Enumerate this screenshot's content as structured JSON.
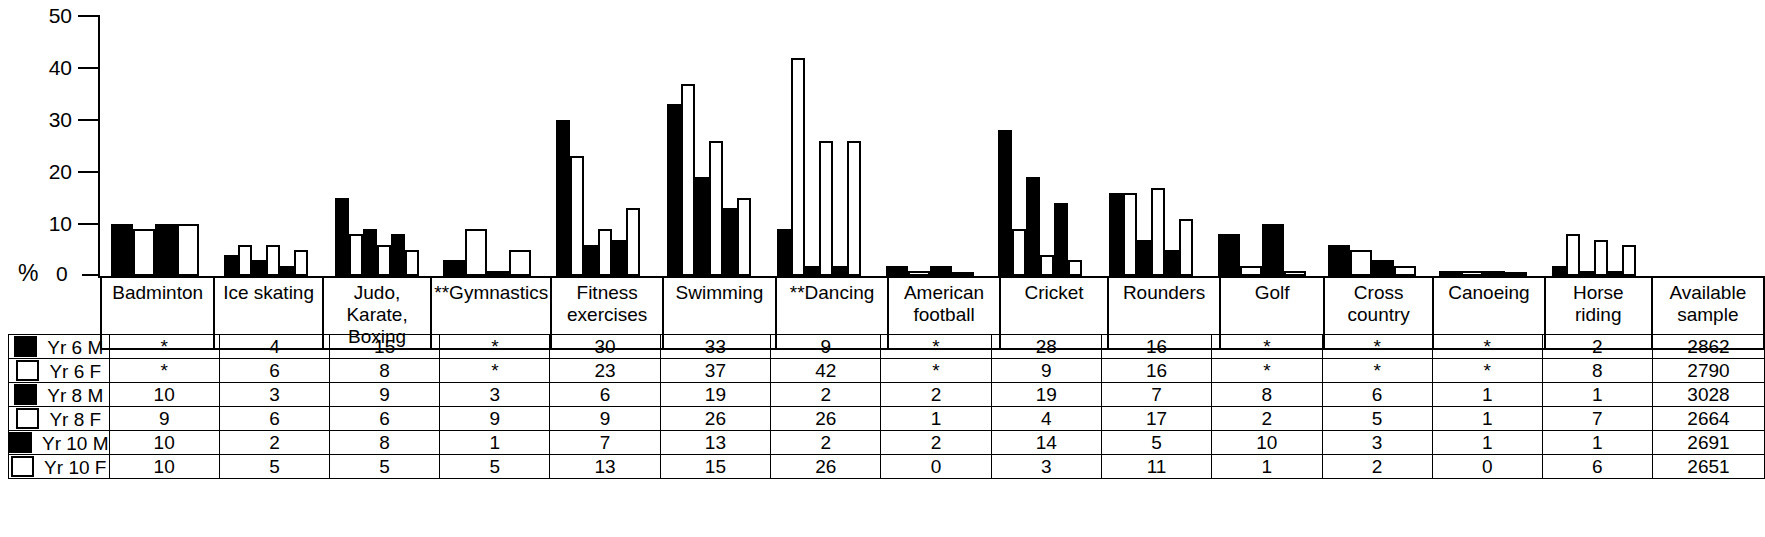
{
  "axis": {
    "y_label": "%",
    "ticks": [
      "50",
      "40",
      "30",
      "20",
      "10"
    ],
    "zero": "0"
  },
  "table": {
    "row_labels": [
      "Yr 6 M",
      "Yr 6 F",
      "Yr 8 M",
      "Yr 8 F",
      "Yr 10 M",
      "Yr 10 F"
    ],
    "row_marker": [
      "m",
      "f",
      "m",
      "f",
      "m",
      "f"
    ],
    "columns": [
      "Badminton",
      "Ice skating",
      "Judo,\nKarate,\nBoxing",
      "**Gymnastics",
      "Fitness\nexercises",
      "Swimming",
      "**Dancing",
      "American\nfootball",
      "Cricket",
      "Rounders",
      "Golf",
      "Cross country",
      "Canoeing",
      "Horse riding",
      "Available\nsample"
    ],
    "rows": [
      [
        "*",
        "4",
        "15",
        "*",
        "30",
        "33",
        "9",
        "*",
        "28",
        "16",
        "*",
        "*",
        "*",
        "2",
        "2862"
      ],
      [
        "*",
        "6",
        "8",
        "*",
        "23",
        "37",
        "42",
        "*",
        "9",
        "16",
        "*",
        "*",
        "*",
        "8",
        "2790"
      ],
      [
        "10",
        "3",
        "9",
        "3",
        "6",
        "19",
        "2",
        "2",
        "19",
        "7",
        "8",
        "6",
        "1",
        "1",
        "3028"
      ],
      [
        "9",
        "6",
        "6",
        "9",
        "9",
        "26",
        "26",
        "1",
        "4",
        "17",
        "2",
        "5",
        "1",
        "7",
        "2664"
      ],
      [
        "10",
        "2",
        "8",
        "1",
        "7",
        "13",
        "2",
        "2",
        "14",
        "5",
        "10",
        "3",
        "1",
        "1",
        "2691"
      ],
      [
        "10",
        "5",
        "5",
        "5",
        "13",
        "15",
        "26",
        "0",
        "3",
        "11",
        "1",
        "2",
        "0",
        "6",
        "2651"
      ]
    ]
  },
  "chart_data": {
    "type": "bar",
    "title": "",
    "xlabel": "",
    "ylabel": "%",
    "ylim": [
      0,
      50
    ],
    "yticks": [
      0,
      10,
      20,
      30,
      40,
      50
    ],
    "grid": false,
    "legend_position": "table-left",
    "categories": [
      "Badminton",
      "Ice skating",
      "Judo, Karate, Boxing",
      "**Gymnastics",
      "Fitness exercises",
      "Swimming",
      "**Dancing",
      "American football",
      "Cricket",
      "Rounders",
      "Golf",
      "Cross country",
      "Canoeing",
      "Horse riding"
    ],
    "series": [
      {
        "name": "Yr 6 M",
        "style": "filled",
        "values": [
          null,
          4,
          15,
          null,
          30,
          33,
          9,
          null,
          28,
          16,
          null,
          null,
          null,
          2
        ]
      },
      {
        "name": "Yr 6 F",
        "style": "outline",
        "values": [
          null,
          6,
          8,
          null,
          23,
          37,
          42,
          null,
          9,
          16,
          null,
          null,
          null,
          8
        ]
      },
      {
        "name": "Yr 8 M",
        "style": "filled",
        "values": [
          10,
          3,
          9,
          3,
          6,
          19,
          2,
          2,
          19,
          7,
          8,
          6,
          1,
          1
        ]
      },
      {
        "name": "Yr 8 F",
        "style": "outline",
        "values": [
          9,
          6,
          6,
          9,
          9,
          26,
          26,
          1,
          4,
          17,
          2,
          5,
          1,
          7
        ]
      },
      {
        "name": "Yr 10 M",
        "style": "filled",
        "values": [
          10,
          2,
          8,
          1,
          7,
          13,
          2,
          2,
          14,
          5,
          10,
          3,
          1,
          1
        ]
      },
      {
        "name": "Yr 10 F",
        "style": "outline",
        "values": [
          10,
          5,
          5,
          5,
          13,
          15,
          26,
          0,
          3,
          11,
          1,
          2,
          0,
          6
        ]
      }
    ],
    "available_sample": {
      "label": "Available sample",
      "values": [
        2862,
        2790,
        3028,
        2664,
        2691,
        2651
      ]
    }
  },
  "colors": {
    "male_bar": "#000000",
    "female_bar": "#ffffff",
    "outline": "#000000",
    "background": "#ffffff"
  }
}
